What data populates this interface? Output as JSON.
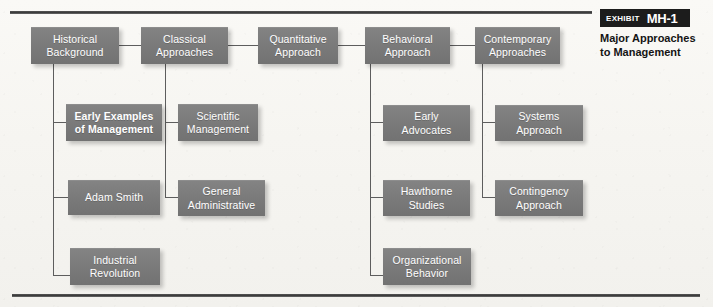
{
  "exhibit": {
    "label": "EXHIBIT",
    "code": "MH-1",
    "caption": "Major Approaches\nto Management"
  },
  "diagram": {
    "title": "Major Approaches to Management",
    "nodes": [
      {
        "id": "historical-background",
        "label": "Historical\nBackground",
        "bold": false
      },
      {
        "id": "classical-approaches",
        "label": "Classical\nApproaches",
        "bold": false
      },
      {
        "id": "quantitative-approach",
        "label": "Quantitative\nApproach",
        "bold": false
      },
      {
        "id": "behavioral-approach",
        "label": "Behavioral\nApproach",
        "bold": false
      },
      {
        "id": "contemporary-approaches",
        "label": "Contemporary\nApproaches",
        "bold": false
      },
      {
        "id": "early-examples",
        "label": "Early Examples\nof Management",
        "bold": true
      },
      {
        "id": "adam-smith",
        "label": "Adam Smith",
        "bold": false
      },
      {
        "id": "industrial-revolution",
        "label": "Industrial\nRevolution",
        "bold": false
      },
      {
        "id": "scientific-management",
        "label": "Scientific\nManagement",
        "bold": false
      },
      {
        "id": "general-administrative",
        "label": "General\nAdministrative",
        "bold": false
      },
      {
        "id": "early-advocates",
        "label": "Early\nAdvocates",
        "bold": false
      },
      {
        "id": "hawthorne-studies",
        "label": "Hawthorne\nStudies",
        "bold": false
      },
      {
        "id": "organizational-behavior",
        "label": "Organizational\nBehavior",
        "bold": false
      },
      {
        "id": "systems-approach",
        "label": "Systems\nApproach",
        "bold": false
      },
      {
        "id": "contingency-approach",
        "label": "Contingency\nApproach",
        "bold": false
      }
    ],
    "colors": {
      "node_fill": "#7a7a7a",
      "node_text": "#ffffff",
      "connector": "#5d5d5d",
      "rule": "#3a3a3a",
      "badge": "#1c1c1c",
      "background": "#f8f7f4"
    }
  }
}
